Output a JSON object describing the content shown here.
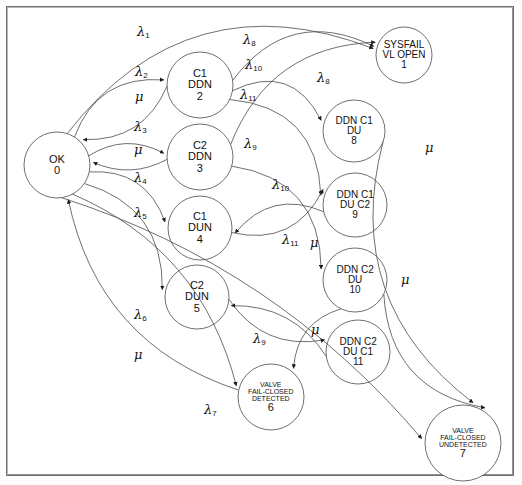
{
  "diagram": {
    "type": "markov-state-transition-diagram",
    "stroke_color": "#555555",
    "text_color": "#111111",
    "background": "#ffffff",
    "nodes": [
      {
        "id": "0",
        "number": "0",
        "lines": [
          "OK"
        ],
        "cx": 57,
        "cy": 165,
        "r": 33,
        "font": 11,
        "name": "state-ok-0"
      },
      {
        "id": "1",
        "number": "1",
        "lines": [
          "SYSFAIL",
          "VL OPEN"
        ],
        "cx": 404,
        "cy": 55,
        "r": 28,
        "font": 10,
        "name": "state-sysfail-vl-open-1"
      },
      {
        "id": "2",
        "number": "2",
        "lines": [
          "C1",
          "DDN"
        ],
        "cx": 200,
        "cy": 85,
        "r": 33,
        "font": 11,
        "name": "state-c1-ddn-2"
      },
      {
        "id": "3",
        "number": "3",
        "lines": [
          "C2",
          "DDN"
        ],
        "cx": 200,
        "cy": 157,
        "r": 33,
        "font": 11,
        "name": "state-c2-ddn-3"
      },
      {
        "id": "4",
        "number": "4",
        "lines": [
          "C1",
          "DUN"
        ],
        "cx": 200,
        "cy": 228,
        "r": 32,
        "font": 11,
        "name": "state-c1-dun-4"
      },
      {
        "id": "5",
        "number": "5",
        "lines": [
          "C2",
          "DUN"
        ],
        "cx": 197,
        "cy": 297,
        "r": 32,
        "font": 11,
        "name": "state-c2-dun-5"
      },
      {
        "id": "6",
        "number": "6",
        "lines": [
          "VALVE",
          "FAIL-CLOSED",
          "DETECTED"
        ],
        "cx": 271,
        "cy": 397,
        "r": 33,
        "font": 7,
        "name": "state-valve-fail-closed-detected-6"
      },
      {
        "id": "7",
        "number": "7",
        "lines": [
          "VALVE",
          "FAIL-CLOSED",
          "UNDETECTED"
        ],
        "cx": 463,
        "cy": 443,
        "r": 38,
        "font": 7,
        "name": "state-valve-fail-closed-undetected-7"
      },
      {
        "id": "8",
        "number": "8",
        "lines": [
          "DDN C1",
          "DU"
        ],
        "cx": 354,
        "cy": 131,
        "r": 31,
        "font": 10,
        "name": "state-ddn-c1-du-8"
      },
      {
        "id": "9",
        "number": "9",
        "lines": [
          "DDN C1",
          "DU C2"
        ],
        "cx": 355,
        "cy": 205,
        "r": 32,
        "font": 10,
        "name": "state-ddn-c1-du-c2-9"
      },
      {
        "id": "10",
        "number": "10",
        "lines": [
          "DDN C2",
          "DU"
        ],
        "cx": 355,
        "cy": 280,
        "r": 32,
        "font": 10,
        "name": "state-ddn-c2-du-10"
      },
      {
        "id": "11",
        "number": "11",
        "lines": [
          "DDN C2",
          "DU C1"
        ],
        "cx": 358,
        "cy": 352,
        "r": 32,
        "font": 10,
        "name": "state-ddn-c2-du-c1-11"
      }
    ],
    "edge_labels": [
      {
        "symbol": "λ",
        "sub": "1",
        "x": 137,
        "y": 24,
        "name": "edge-label-lambda-1",
        "from": "0",
        "to": "1"
      },
      {
        "symbol": "λ",
        "sub": "8",
        "x": 243,
        "y": 32,
        "name": "edge-label-lambda-8-a",
        "from": "2",
        "to": "1"
      },
      {
        "symbol": "λ",
        "sub": "2",
        "x": 135,
        "y": 64,
        "name": "edge-label-lambda-2",
        "from": "0",
        "to": "2"
      },
      {
        "symbol": "λ",
        "sub": "10",
        "x": 245,
        "y": 57,
        "name": "edge-label-lambda-10-a",
        "from": "2",
        "to": "8"
      },
      {
        "symbol": "λ",
        "sub": "8",
        "x": 317,
        "y": 70,
        "name": "edge-label-lambda-8-b",
        "from": "3",
        "to": "1"
      },
      {
        "symbol": "μ",
        "sub": "",
        "x": 135,
        "y": 89,
        "name": "edge-label-mu-2-0",
        "from": "2",
        "to": "0"
      },
      {
        "symbol": "λ",
        "sub": "11",
        "x": 240,
        "y": 87,
        "name": "edge-label-lambda-11-a",
        "from": "2",
        "to": "9"
      },
      {
        "symbol": "λ",
        "sub": "3",
        "x": 134,
        "y": 119,
        "name": "edge-label-lambda-3",
        "from": "0",
        "to": "3"
      },
      {
        "symbol": "μ",
        "sub": "",
        "x": 134,
        "y": 142,
        "name": "edge-label-mu-3-0",
        "from": "3",
        "to": "0"
      },
      {
        "symbol": "λ",
        "sub": "9",
        "x": 244,
        "y": 136,
        "name": "edge-label-lambda-9-a",
        "from": "3",
        "to": "10"
      },
      {
        "symbol": "μ",
        "sub": "",
        "x": 425,
        "y": 140,
        "name": "edge-label-mu-8-7",
        "from": "8",
        "to": "7"
      },
      {
        "symbol": "λ",
        "sub": "4",
        "x": 134,
        "y": 170,
        "name": "edge-label-lambda-4",
        "from": "0",
        "to": "4"
      },
      {
        "symbol": "λ",
        "sub": "10",
        "x": 272,
        "y": 177,
        "name": "edge-label-lambda-10-b",
        "from": "4",
        "to": "9"
      },
      {
        "symbol": "λ",
        "sub": "5",
        "x": 134,
        "y": 205,
        "name": "edge-label-lambda-5",
        "from": "0",
        "to": "5"
      },
      {
        "symbol": "λ",
        "sub": "11",
        "x": 282,
        "y": 232,
        "name": "edge-label-lambda-11-b",
        "from": "5",
        "to": "11"
      },
      {
        "symbol": "μ",
        "sub": "",
        "x": 310,
        "y": 235,
        "name": "edge-label-mu-9-4",
        "from": "9",
        "to": "4"
      },
      {
        "symbol": "μ",
        "sub": "",
        "x": 401,
        "y": 272,
        "name": "edge-label-mu-10-7",
        "from": "10",
        "to": "7"
      },
      {
        "symbol": "λ",
        "sub": "6",
        "x": 134,
        "y": 307,
        "name": "edge-label-lambda-6",
        "from": "0",
        "to": "6"
      },
      {
        "symbol": "μ",
        "sub": "",
        "x": 311,
        "y": 322,
        "name": "edge-label-mu-11-5",
        "from": "11",
        "to": "5"
      },
      {
        "symbol": "λ",
        "sub": "9",
        "x": 253,
        "y": 331,
        "name": "edge-label-lambda-9-b",
        "from": "10",
        "to": "6"
      },
      {
        "symbol": "μ",
        "sub": "",
        "x": 134,
        "y": 347,
        "name": "edge-label-mu-6-0",
        "from": "6",
        "to": "0"
      },
      {
        "symbol": "λ",
        "sub": "7",
        "x": 204,
        "y": 402,
        "name": "edge-label-lambda-7",
        "from": "0",
        "to": "7"
      }
    ]
  }
}
